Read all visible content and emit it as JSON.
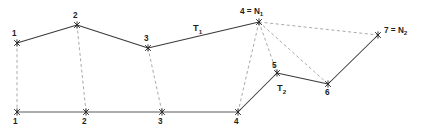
{
  "figure": {
    "colors": {
      "solid_edge": "#3a3a3a",
      "baseline_edge": "#5a5a5a",
      "dashed_edge": "#9a9a9a",
      "label_text": "#1e1e1e",
      "background": "#ffffff"
    }
  },
  "upper_nodes": [
    {
      "id": "u1",
      "label": "1",
      "x": 17,
      "y": 43,
      "label_x": 12,
      "label_y": 36
    },
    {
      "id": "u2",
      "label": "2",
      "x": 77,
      "y": 25,
      "label_x": 73,
      "label_y": 18
    },
    {
      "id": "u3",
      "label": "3",
      "x": 148,
      "y": 48,
      "label_x": 144,
      "label_y": 41
    },
    {
      "id": "u4",
      "label": "4 = N",
      "sub": "1",
      "x": 259,
      "y": 22,
      "label_x": 240,
      "label_y": 14
    },
    {
      "id": "u5",
      "label": "5",
      "x": 277,
      "y": 73,
      "label_x": 272,
      "label_y": 68
    },
    {
      "id": "u6",
      "label": "6",
      "x": 328,
      "y": 84,
      "label_x": 325,
      "label_y": 95
    },
    {
      "id": "u7",
      "label": "7 = N",
      "sub": "2",
      "x": 378,
      "y": 35,
      "label_x": 384,
      "label_y": 33
    }
  ],
  "lower_nodes": [
    {
      "id": "l1",
      "label": "1",
      "x": 17,
      "y": 112,
      "label_x": 13,
      "label_y": 124
    },
    {
      "id": "l2",
      "label": "2",
      "x": 86,
      "y": 112,
      "label_x": 82,
      "label_y": 124
    },
    {
      "id": "l3",
      "label": "3",
      "x": 162,
      "y": 112,
      "label_x": 158,
      "label_y": 124
    },
    {
      "id": "l4",
      "label": "4",
      "x": 238,
      "y": 112,
      "label_x": 234,
      "label_y": 124
    }
  ],
  "region_labels": [
    {
      "id": "t1",
      "label": "T",
      "sub": "1",
      "x": 193,
      "y": 31
    },
    {
      "id": "t2",
      "label": "T",
      "sub": "2",
      "x": 277,
      "y": 91
    }
  ],
  "solid_edges": [
    {
      "id": "e-u1-u2",
      "x1": 17,
      "y1": 43,
      "x2": 77,
      "y2": 25
    },
    {
      "id": "e-u2-u3",
      "x1": 77,
      "y1": 25,
      "x2": 148,
      "y2": 48
    },
    {
      "id": "e-u3-u4",
      "x1": 148,
      "y1": 48,
      "x2": 259,
      "y2": 22
    },
    {
      "id": "e-l4-u5",
      "x1": 238,
      "y1": 112,
      "x2": 277,
      "y2": 73
    },
    {
      "id": "e-u5-u6",
      "x1": 277,
      "y1": 73,
      "x2": 328,
      "y2": 84
    },
    {
      "id": "e-u6-u7",
      "x1": 328,
      "y1": 84,
      "x2": 378,
      "y2": 35
    }
  ],
  "baseline_edges": [
    {
      "id": "e-baseline",
      "x1": 17,
      "y1": 112,
      "x2": 238,
      "y2": 112
    }
  ],
  "dashed_edges": [
    {
      "id": "d-u1-l1",
      "x1": 17,
      "y1": 43,
      "x2": 17,
      "y2": 112
    },
    {
      "id": "d-u2-l2",
      "x1": 77,
      "y1": 25,
      "x2": 86,
      "y2": 112
    },
    {
      "id": "d-u3-l3",
      "x1": 148,
      "y1": 48,
      "x2": 162,
      "y2": 112
    },
    {
      "id": "d-u4-l4",
      "x1": 259,
      "y1": 22,
      "x2": 238,
      "y2": 112
    },
    {
      "id": "d-u4-u5",
      "x1": 259,
      "y1": 22,
      "x2": 277,
      "y2": 73
    },
    {
      "id": "d-u4-u6",
      "x1": 259,
      "y1": 22,
      "x2": 328,
      "y2": 84
    },
    {
      "id": "d-u4-u7",
      "x1": 259,
      "y1": 22,
      "x2": 378,
      "y2": 35
    }
  ]
}
